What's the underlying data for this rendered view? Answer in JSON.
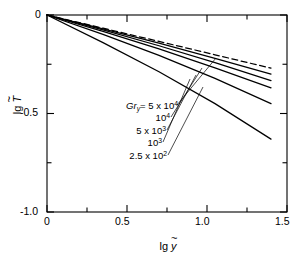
{
  "chart_data": {
    "type": "line",
    "title": "",
    "xlabel": "lg ỹ",
    "ylabel": "lg T̃",
    "xlim": [
      0,
      1.5
    ],
    "ylim": [
      -1.0,
      0.0
    ],
    "grid": false,
    "legend_position": "inside-left",
    "x_ticks_major": [
      "0",
      "0.5",
      "1.0",
      "1.5"
    ],
    "x_ticks_major_values": [
      0,
      0.5,
      1.0,
      1.5
    ],
    "x_ticks_minor_values": [
      0.25,
      0.75,
      1.25
    ],
    "y_ticks_major": [
      "0",
      "-0.5",
      "-1.0"
    ],
    "y_ticks_major_values": [
      0,
      -0.5,
      -1.0
    ],
    "y_ticks_minor_values": [
      -0.25,
      -0.75
    ],
    "series": [
      {
        "name": "asymptote",
        "label": "",
        "style": "dashed",
        "x": [
          0,
          0.35,
          0.7,
          1.05,
          1.4
        ],
        "values": [
          0,
          -0.067,
          -0.134,
          -0.202,
          -0.27
        ]
      },
      {
        "name": "Gr_y = 5 x 10^4",
        "label": "Gr_y= 5 x 10^4",
        "style": "solid",
        "x": [
          0,
          0.35,
          0.7,
          1.05,
          1.4
        ],
        "values": [
          0,
          -0.07,
          -0.143,
          -0.22,
          -0.3
        ]
      },
      {
        "name": "Gr_y = 10^4",
        "label": "10^4",
        "style": "solid",
        "x": [
          0,
          0.35,
          0.7,
          1.05,
          1.4
        ],
        "values": [
          0,
          -0.076,
          -0.156,
          -0.242,
          -0.333
        ]
      },
      {
        "name": "Gr_y = 5 x 10^3",
        "label": "5 x 10^3",
        "style": "solid",
        "x": [
          0,
          0.35,
          0.7,
          1.05,
          1.4
        ],
        "values": [
          0,
          -0.083,
          -0.172,
          -0.268,
          -0.37
        ]
      },
      {
        "name": "Gr_y = 10^3",
        "label": "10^3",
        "style": "solid",
        "x": [
          0,
          0.35,
          0.7,
          1.05,
          1.4
        ],
        "values": [
          0,
          -0.098,
          -0.205,
          -0.322,
          -0.45
        ]
      },
      {
        "name": "Gr_y = 2.5 x 10^2",
        "label": "2.5 x 10^2",
        "style": "solid",
        "x": [
          0,
          0.35,
          0.7,
          1.05,
          1.4
        ],
        "values": [
          0,
          -0.14,
          -0.288,
          -0.45,
          -0.63
        ]
      }
    ]
  },
  "axes": {
    "x_label_prefix": "lg",
    "x_label_symbol": "y",
    "y_label_prefix": "lg",
    "y_label_symbol": "T",
    "x_tick_labels": [
      "0",
      "0.5",
      "1.0",
      "1.5"
    ],
    "y_tick_labels": [
      "0",
      "-0.5",
      "-1.0"
    ]
  },
  "annotations": {
    "gr_symbol": "Gr",
    "gr_subscript": "y",
    "equals": "=",
    "times": "x",
    "entries": [
      {
        "id": "gr-5e4",
        "mantissa": "5",
        "base": "10",
        "exponent": "4",
        "with_prefix": true
      },
      {
        "id": "gr-1e4",
        "mantissa": "",
        "base": "10",
        "exponent": "4",
        "with_prefix": false
      },
      {
        "id": "gr-5e3",
        "mantissa": "5",
        "base": "10",
        "exponent": "3",
        "with_prefix": false
      },
      {
        "id": "gr-1e3",
        "mantissa": "",
        "base": "10",
        "exponent": "3",
        "with_prefix": false
      },
      {
        "id": "gr-25e2",
        "mantissa": "2.5",
        "base": "10",
        "exponent": "2",
        "with_prefix": false
      }
    ]
  },
  "colors": {
    "line": "#000000",
    "frame": "#000000",
    "background": "#ffffff"
  }
}
